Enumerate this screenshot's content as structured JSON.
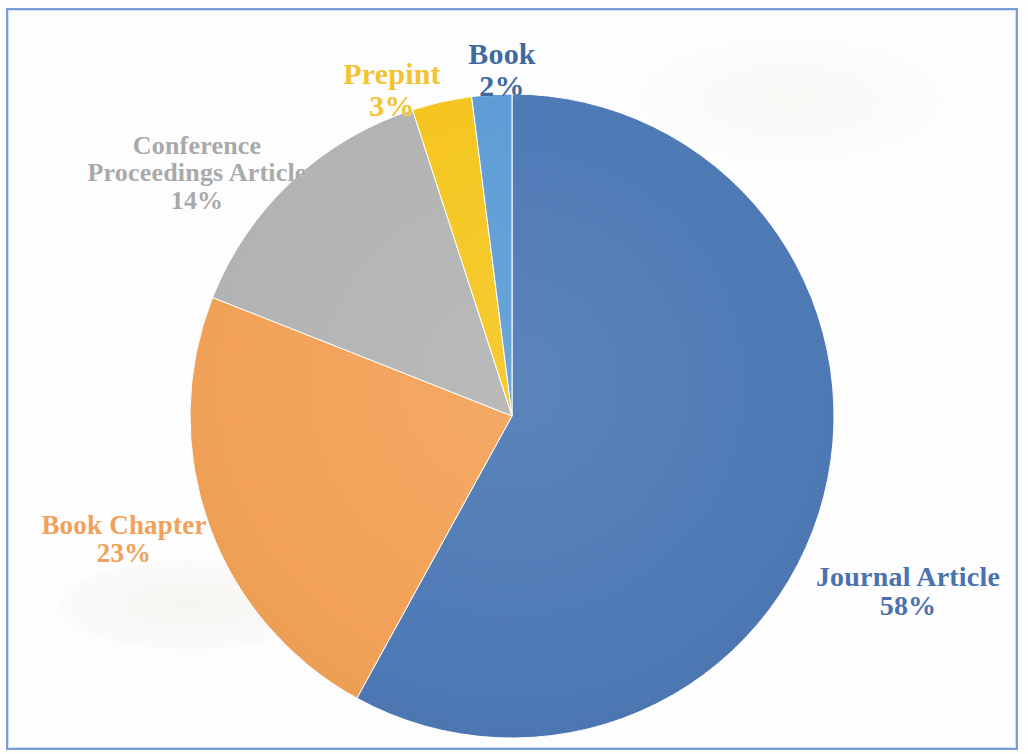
{
  "figure": {
    "background_color": "#fdfdfd",
    "frame_color": "#7a9ed4"
  },
  "chart_data": {
    "type": "pie",
    "title": "",
    "categories": [
      "Journal Article",
      "Book Chapter",
      "Conference Proceedings Article",
      "Prepint",
      "Book"
    ],
    "values": [
      58,
      23,
      14,
      3,
      2
    ],
    "value_labels": [
      "58%",
      "23%",
      "14%",
      "3%",
      "2%"
    ],
    "colors": [
      "#4a77b4",
      "#f2a054",
      "#b2b2b2",
      "#f5c51c",
      "#5b9bd5"
    ],
    "start_angle_deg": 0,
    "direction": "clockwise",
    "legend": "none",
    "labels_position": "outside",
    "units": "percent"
  },
  "labels": {
    "journal": {
      "name": "Journal Article",
      "pct": "58%",
      "color": "#4a72ae"
    },
    "book_chapter": {
      "name": "Book Chapter",
      "pct": "23%",
      "color": "#f0a15c"
    },
    "conference": {
      "name": "Conference\nProceedings Article",
      "pct": "14%",
      "color": "#a9a9a9"
    },
    "prepint": {
      "name": "Prepint",
      "pct": "3%",
      "color": "#f2c431"
    },
    "book": {
      "name": "Book",
      "pct": "2%",
      "color": "#41699f"
    }
  }
}
